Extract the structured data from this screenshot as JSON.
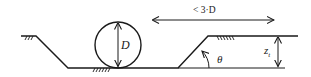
{
  "diagram": {
    "type": "pipe-in-trench cross-section",
    "labels": {
      "diameter": "D",
      "spacing": "< 3·D",
      "angle": "θ",
      "trench_depth_main": "z",
      "trench_depth_sub": "t"
    },
    "colors": {
      "stroke": "#1a1a1a",
      "background": "#ffffff"
    }
  }
}
